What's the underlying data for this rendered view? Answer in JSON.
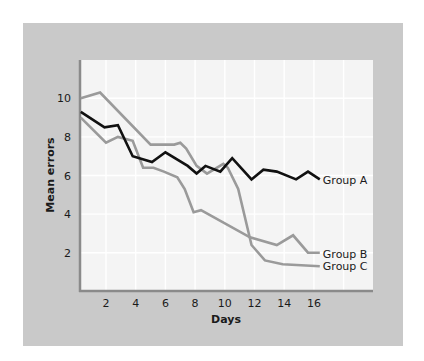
{
  "chart_data": {
    "type": "line",
    "title": "",
    "xlabel": "Days",
    "ylabel": "Mean errors",
    "xlim": [
      0,
      19.8
    ],
    "ylim": [
      0,
      11.7
    ],
    "xticks": [
      2,
      4,
      6,
      8,
      10,
      12,
      14,
      16
    ],
    "yticks": [
      2,
      4,
      6,
      8,
      10
    ],
    "grid": true,
    "legend_position": "inline-right",
    "series": [
      {
        "name": "Group A",
        "color": "#111111",
        "points": [
          [
            0.3,
            9.3
          ],
          [
            1.9,
            8.5
          ],
          [
            2.8,
            8.6
          ],
          [
            3.8,
            7.0
          ],
          [
            5.1,
            6.7
          ],
          [
            6.0,
            7.2
          ],
          [
            7.5,
            6.5
          ],
          [
            8.1,
            6.1
          ],
          [
            8.7,
            6.5
          ],
          [
            9.7,
            6.2
          ],
          [
            10.5,
            6.9
          ],
          [
            11.8,
            5.8
          ],
          [
            12.6,
            6.3
          ],
          [
            13.5,
            6.2
          ],
          [
            14.8,
            5.8
          ],
          [
            15.6,
            6.2
          ],
          [
            16.4,
            5.8
          ]
        ]
      },
      {
        "name": "Group B",
        "color": "#9a9a9a",
        "points": [
          [
            0.3,
            9.0
          ],
          [
            2.0,
            7.7
          ],
          [
            2.8,
            8.0
          ],
          [
            3.8,
            7.8
          ],
          [
            4.5,
            6.4
          ],
          [
            5.2,
            6.4
          ],
          [
            5.9,
            6.2
          ],
          [
            6.8,
            5.9
          ],
          [
            7.3,
            5.3
          ],
          [
            7.9,
            4.1
          ],
          [
            8.4,
            4.2
          ],
          [
            11.7,
            2.8
          ],
          [
            13.5,
            2.4
          ],
          [
            14.6,
            2.9
          ],
          [
            15.6,
            2.0
          ],
          [
            16.4,
            2.0
          ]
        ]
      },
      {
        "name": "Group C",
        "color": "#9a9a9a",
        "points": [
          [
            0.3,
            10.0
          ],
          [
            1.6,
            10.3
          ],
          [
            5.0,
            7.6
          ],
          [
            6.6,
            7.6
          ],
          [
            7.0,
            7.7
          ],
          [
            7.4,
            7.4
          ],
          [
            8.1,
            6.5
          ],
          [
            8.8,
            6.1
          ],
          [
            9.9,
            6.6
          ],
          [
            10.2,
            6.4
          ],
          [
            10.9,
            5.3
          ],
          [
            11.8,
            2.4
          ],
          [
            12.7,
            1.6
          ],
          [
            13.9,
            1.4
          ],
          [
            16.4,
            1.3
          ]
        ]
      }
    ]
  },
  "colors": {
    "panel_bg": "#c9c9c9",
    "plot_bg": "#f4f4f4",
    "grid": "#ffffff",
    "axis": "#8a8a8a"
  }
}
